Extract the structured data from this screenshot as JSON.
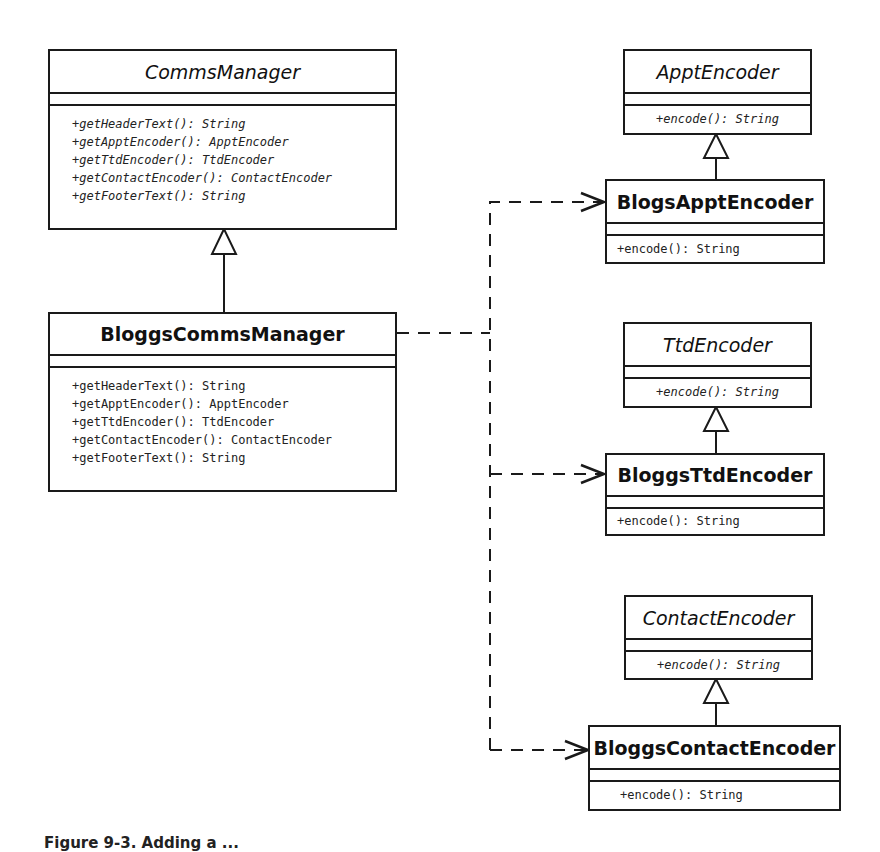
{
  "diagram": {
    "type": "uml-class-diagram",
    "classes": [
      {
        "id": "comms-manager",
        "name": "CommsManager",
        "abstract": true,
        "attributes": [],
        "operations": [
          "+getHeaderText(): String",
          "+getApptEncoder(): ApptEncoder",
          "+getTtdEncoder(): TtdEncoder",
          "+getContactEncoder(): ContactEncoder",
          "+getFooterText(): String"
        ]
      },
      {
        "id": "bloggs-comms-manager",
        "name": "BloggsCommsManager",
        "abstract": false,
        "attributes": [],
        "operations": [
          "+getHeaderText(): String",
          "+getApptEncoder(): ApptEncoder",
          "+getTtdEncoder(): TtdEncoder",
          "+getContactEncoder(): ContactEncoder",
          "+getFooterText(): String"
        ]
      },
      {
        "id": "appt-encoder",
        "name": "ApptEncoder",
        "abstract": true,
        "attributes": [],
        "operations": [
          "+encode(): String"
        ]
      },
      {
        "id": "blogs-appt-encoder",
        "name": "BlogsApptEncoder",
        "abstract": false,
        "attributes": [],
        "operations": [
          "+encode(): String"
        ]
      },
      {
        "id": "ttd-encoder",
        "name": "TtdEncoder",
        "abstract": true,
        "attributes": [],
        "operations": [
          "+encode(): String"
        ]
      },
      {
        "id": "bloggs-ttd-encoder",
        "name": "BloggsTtdEncoder",
        "abstract": false,
        "attributes": [],
        "operations": [
          "+encode(): String"
        ]
      },
      {
        "id": "contact-encoder",
        "name": "ContactEncoder",
        "abstract": true,
        "attributes": [],
        "operations": [
          "+encode(): String"
        ]
      },
      {
        "id": "bloggs-contact-encoder",
        "name": "BloggsContactEncoder",
        "abstract": false,
        "attributes": [],
        "operations": [
          "+encode(): String"
        ]
      }
    ],
    "relationships": [
      {
        "type": "generalization",
        "from": "BloggsCommsManager",
        "to": "CommsManager"
      },
      {
        "type": "generalization",
        "from": "BlogsApptEncoder",
        "to": "ApptEncoder"
      },
      {
        "type": "generalization",
        "from": "BloggsTtdEncoder",
        "to": "TtdEncoder"
      },
      {
        "type": "generalization",
        "from": "BloggsContactEncoder",
        "to": "ContactEncoder"
      },
      {
        "type": "dependency",
        "from": "BloggsCommsManager",
        "to": "BlogsApptEncoder"
      },
      {
        "type": "dependency",
        "from": "BloggsCommsManager",
        "to": "BloggsTtdEncoder"
      },
      {
        "type": "dependency",
        "from": "BloggsCommsManager",
        "to": "BloggsContactEncoder"
      }
    ],
    "colors": {
      "line": "#1a1a1a",
      "background": "#ffffff"
    }
  },
  "caption": {
    "text": "Figure 9-3. Adding a ..."
  }
}
